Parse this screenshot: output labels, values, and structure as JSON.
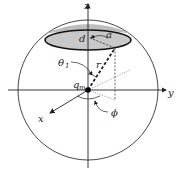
{
  "diagram": {
    "labels": {
      "z_axis": "z",
      "y_axis": "y",
      "x_axis": "x",
      "disk_distance": "d",
      "disk_radius": "a",
      "theta": "θ",
      "theta_sub": "1",
      "radius_vector": "r",
      "charge": "q",
      "charge_sub": "m",
      "phi": "ϕ"
    },
    "colors": {
      "line": "#222222",
      "disk_fill": "#c8c8c8",
      "background": "#ffffff"
    }
  }
}
